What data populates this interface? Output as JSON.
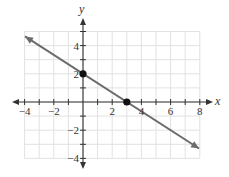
{
  "chart_data": {
    "type": "line",
    "title": "",
    "xlabel": "x",
    "ylabel": "y",
    "xlim": [
      -4,
      8
    ],
    "ylim": [
      -4,
      5
    ],
    "grid": true,
    "grid_step": 1,
    "x_ticks": [
      -4,
      -2,
      2,
      4,
      6,
      8
    ],
    "y_ticks": [
      -4,
      -2,
      2,
      4
    ],
    "x_tick_labels": [
      "−4",
      "−2",
      "2",
      "4",
      "6",
      "8"
    ],
    "y_tick_labels": [
      "−4",
      "−2",
      "2",
      "4"
    ],
    "series": [
      {
        "name": "line",
        "equation": "y = -2/3 x + 2",
        "slope": -0.6667,
        "intercept": 2,
        "x": [
          -3.97,
          7.95
        ],
        "y": [
          4.65,
          -3.3
        ],
        "arrows": "both"
      }
    ],
    "points": [
      {
        "label": "y-intercept",
        "x": 0,
        "y": 2
      },
      {
        "label": "x-intercept",
        "x": 3,
        "y": 0
      }
    ],
    "colors": {
      "line": "#6b6b6b",
      "grid": "#e2e2e2",
      "axis": "#333333",
      "point": "#111111"
    }
  }
}
